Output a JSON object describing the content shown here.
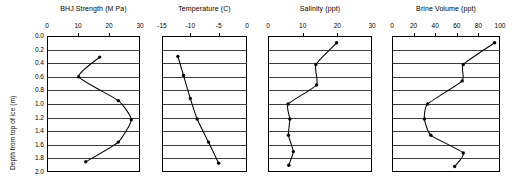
{
  "figure": {
    "width": 515,
    "height": 182,
    "background": "#ffffff",
    "line_color": "#000000",
    "grid_color": "#3d3d3d",
    "y_axis_label": "Depth from top of ice (m)",
    "y_tick_labels": [
      "0.0",
      "0.2",
      "0.4",
      "0.6",
      "0.8",
      "1.0",
      "1.2",
      "1.4",
      "1.6",
      "1.8",
      "2.0"
    ],
    "y_ticks": [
      0.0,
      0.2,
      0.4,
      0.6,
      0.8,
      1.0,
      1.2,
      1.4,
      1.6,
      1.8,
      2.0
    ],
    "y_range": [
      0.0,
      2.0
    ]
  },
  "chart_data": [
    {
      "type": "line",
      "title": "BHJ Strength (M Pa)",
      "xlabel": "BHJ Strength (M Pa)",
      "ylabel": "Depth from top of ice (m)",
      "xlim": [
        0,
        30
      ],
      "ylim": [
        0,
        2.0
      ],
      "x_ticks": [
        0,
        10,
        20,
        30
      ],
      "x_tick_labels": [
        "0",
        "10",
        "20",
        "30"
      ],
      "y_ticks": [
        0.0,
        0.2,
        0.4,
        0.6,
        0.8,
        1.0,
        1.2,
        1.4,
        1.6,
        1.8,
        2.0
      ],
      "y_tick_labels": [
        "0.0",
        "0.2",
        "0.4",
        "0.6",
        "0.8",
        "1.0",
        "1.2",
        "1.4",
        "1.6",
        "1.8",
        "2.0"
      ],
      "grid": "horizontal",
      "y_inverted": true,
      "marker": "filled-circle",
      "points": [
        {
          "x": 17.0,
          "y": 0.31
        },
        {
          "x": 10.2,
          "y": 0.6
        },
        {
          "x": 23.0,
          "y": 0.95
        },
        {
          "x": 27.2,
          "y": 1.23
        },
        {
          "x": 23.0,
          "y": 1.56
        },
        {
          "x": 12.5,
          "y": 1.85
        }
      ]
    },
    {
      "type": "line",
      "title": "Temperature (C)",
      "xlabel": "Temperature (C)",
      "ylabel": "Depth from top of ice (m)",
      "xlim": [
        -15,
        0
      ],
      "ylim": [
        0,
        2.0
      ],
      "x_ticks": [
        -15,
        -10,
        -5,
        0
      ],
      "x_tick_labels": [
        "-15",
        "-10",
        "-5",
        "0"
      ],
      "y_ticks": [
        0.0,
        0.2,
        0.4,
        0.6,
        0.8,
        1.0,
        1.2,
        1.4,
        1.6,
        1.8,
        2.0
      ],
      "y_tick_labels": [
        "0.0",
        "0.2",
        "0.4",
        "0.6",
        "0.8",
        "1.0",
        "1.2",
        "1.4",
        "1.6",
        "1.8",
        "2.0"
      ],
      "grid": "horizontal",
      "y_inverted": true,
      "marker": "filled-circle",
      "points": [
        {
          "x": -12.2,
          "y": 0.3
        },
        {
          "x": -11.2,
          "y": 0.58
        },
        {
          "x": -10.0,
          "y": 0.92
        },
        {
          "x": -8.8,
          "y": 1.22
        },
        {
          "x": -6.8,
          "y": 1.56
        },
        {
          "x": -5.0,
          "y": 1.87
        }
      ]
    },
    {
      "type": "line",
      "title": "Salinity (ppt)",
      "xlabel": "Salinity (ppt)",
      "ylabel": "Depth from top of ice (m)",
      "xlim": [
        0,
        30
      ],
      "ylim": [
        0,
        2.0
      ],
      "x_ticks": [
        0,
        10,
        20,
        30
      ],
      "x_tick_labels": [
        "0",
        "10",
        "20",
        "30"
      ],
      "y_ticks": [
        0.0,
        0.2,
        0.4,
        0.6,
        0.8,
        1.0,
        1.2,
        1.4,
        1.6,
        1.8,
        2.0
      ],
      "y_tick_labels": [
        "0.0",
        "0.2",
        "0.4",
        "0.6",
        "0.8",
        "1.0",
        "1.2",
        "1.4",
        "1.6",
        "1.8",
        "2.0"
      ],
      "grid": "horizontal",
      "y_inverted": true,
      "marker": "filled-circle",
      "points": [
        {
          "x": 19.8,
          "y": 0.1
        },
        {
          "x": 13.8,
          "y": 0.42
        },
        {
          "x": 14.0,
          "y": 0.72
        },
        {
          "x": 5.8,
          "y": 1.0
        },
        {
          "x": 6.3,
          "y": 1.22
        },
        {
          "x": 5.9,
          "y": 1.46
        },
        {
          "x": 7.3,
          "y": 1.7
        },
        {
          "x": 6.0,
          "y": 1.9
        }
      ]
    },
    {
      "type": "line",
      "title": "Brine Volume (ppt)",
      "xlabel": "Brine Volume (ppt)",
      "ylabel": "Depth from top of ice (m)",
      "xlim": [
        0,
        100
      ],
      "ylim": [
        0,
        2.0
      ],
      "x_ticks": [
        0,
        20,
        40,
        60,
        80,
        100
      ],
      "x_tick_labels": [
        "0",
        "20",
        "40",
        "60",
        "80",
        "100"
      ],
      "y_ticks": [
        0.0,
        0.2,
        0.4,
        0.6,
        0.8,
        1.0,
        1.2,
        1.4,
        1.6,
        1.8,
        2.0
      ],
      "y_tick_labels": [
        "0.0",
        "0.2",
        "0.4",
        "0.6",
        "0.8",
        "1.0",
        "1.2",
        "1.4",
        "1.6",
        "1.8",
        "2.0"
      ],
      "grid": "horizontal",
      "y_inverted": true,
      "marker": "filled-circle",
      "points": [
        {
          "x": 95.0,
          "y": 0.1
        },
        {
          "x": 66.0,
          "y": 0.42
        },
        {
          "x": 65.0,
          "y": 0.66
        },
        {
          "x": 33.0,
          "y": 1.0
        },
        {
          "x": 30.0,
          "y": 1.22
        },
        {
          "x": 36.0,
          "y": 1.46
        },
        {
          "x": 66.0,
          "y": 1.72
        },
        {
          "x": 58.0,
          "y": 1.92
        }
      ]
    }
  ]
}
